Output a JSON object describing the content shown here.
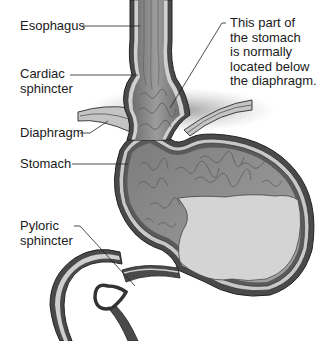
{
  "labels": {
    "esophagus": "Esophagus",
    "cardiac_sphincter": [
      "Cardiac",
      "sphincter"
    ],
    "diaphragm": "Diaphragm",
    "stomach": "Stomach",
    "pyloric_sphincter": [
      "Pyloric",
      "sphincter"
    ],
    "herniated_note": [
      "This part of",
      "the stomach",
      "is normally",
      "located below",
      "the diaphragm."
    ]
  },
  "colors": {
    "tissue_dark": "#6f6f6f",
    "tissue_mid": "#8a8a8a",
    "mucosa": "#9a9a9a",
    "wall_light": "#d6d6d6",
    "contents": "#d3d3d3",
    "diaphragm": "#bdbdbd",
    "shadow": "#a8a8a8",
    "line": "#2a2a2a"
  }
}
